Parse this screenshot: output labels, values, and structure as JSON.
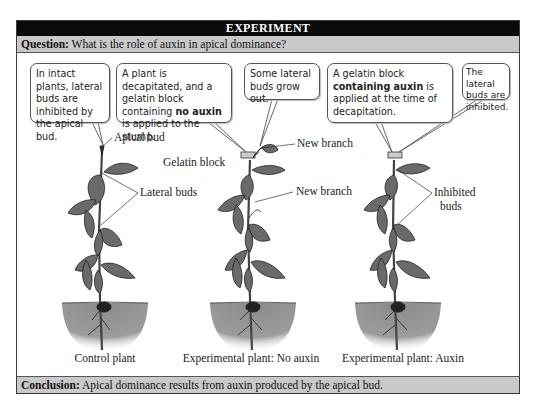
{
  "header": {
    "title": "EXPERIMENT"
  },
  "question": {
    "label": "Question:",
    "text": " What is the role of auxin in apical dominance?"
  },
  "bubbles": [
    {
      "text": "In intact plants, lateral buds are inhibited by the apical bud."
    },
    {
      "pre": "A plant is decapitated, and a gelatin block containing ",
      "bold": "no auxin",
      "post": " is applied to the stump."
    },
    {
      "text": "Some lateral buds grow out."
    },
    {
      "pre": "A gelatin block ",
      "bold": "containing auxin",
      "post": " is applied at the time of decapitation."
    },
    {
      "text": "The lateral buds are inhibited."
    }
  ],
  "labels": {
    "apical_bud": "Apical bud",
    "lateral_buds": "Lateral buds",
    "gelatin_block": "Gelatin block",
    "new_branch_top": "New branch",
    "new_branch_mid": "New branch",
    "inhibited_buds_1": "Inhibited",
    "inhibited_buds_2": "buds"
  },
  "captions": {
    "control": "Control plant",
    "no_auxin": "Experimental plant: No auxin",
    "auxin": "Experimental plant: Auxin"
  },
  "conclusion": {
    "label": "Conclusion:",
    "text": " Apical dominance results from auxin produced by the apical bud."
  },
  "colors": {
    "header_bg": "#0b0b0b",
    "band_bg": "#c9c9c9",
    "soil": "#8f8f8f",
    "leaf": "#6e6e6e"
  }
}
